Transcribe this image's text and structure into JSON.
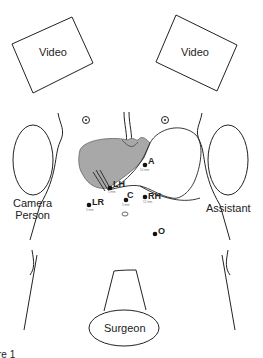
{
  "monitors": [
    {
      "label": "Video"
    },
    {
      "label": "Video"
    }
  ],
  "staff": {
    "camera_person": "Camera\nPerson",
    "camera_person_line1": "Camera",
    "camera_person_line2": "Person",
    "assistant": "Assistant",
    "surgeon": "Surgeon"
  },
  "ports": [
    {
      "id": "A",
      "size": "10 mm"
    },
    {
      "id": "LH",
      "size": "5 mm"
    },
    {
      "id": "C",
      "size": "5 mm"
    },
    {
      "id": "RH",
      "size": "12 mm"
    },
    {
      "id": "LR",
      "size": "5 mm"
    },
    {
      "id": "O",
      "size": ""
    }
  ],
  "caption": "re 1",
  "colors": {
    "line": "#222222",
    "liver": "#a8a8a8",
    "background": "#ffffff"
  }
}
